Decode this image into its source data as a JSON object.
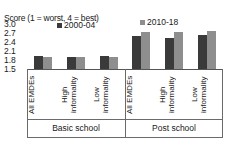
{
  "chart_data": {
    "type": "bar",
    "title": "Score (1 = worst, 4 = best)",
    "xlabel": "",
    "ylabel": "",
    "ylim": [
      1.5,
      3.0
    ],
    "yticks": [
      "3.0",
      "2.7",
      "2.4",
      "2.1",
      "1.8",
      "1.5"
    ],
    "grid": false,
    "legend_position": "top",
    "categories": [
      "All EMDEs",
      "High\ninformality",
      "Low\ninformality",
      "All EMDEs",
      "High\ninformality",
      "Low\ninformality"
    ],
    "groups": [
      {
        "label": "Basic school",
        "categories": [
          "All EMDEs",
          "High\ninformality",
          "Low\ninformality"
        ]
      },
      {
        "label": "Post school",
        "categories": [
          "All EMDEs",
          "High\ninformality",
          "Low\ninformality"
        ]
      }
    ],
    "series": [
      {
        "name": "2000-04",
        "color": "#3a3a3a",
        "values": [
          1.92,
          1.91,
          1.92,
          2.61,
          2.54,
          2.62
        ]
      },
      {
        "name": "2010-18",
        "color": "#8e8e8e",
        "values": [
          1.9,
          1.9,
          1.9,
          2.75,
          2.73,
          2.76
        ]
      }
    ]
  },
  "legend": [
    {
      "label": "2000-04",
      "color": "#3a3a3a"
    },
    {
      "label": "2010-18",
      "color": "#8e8e8e"
    }
  ]
}
